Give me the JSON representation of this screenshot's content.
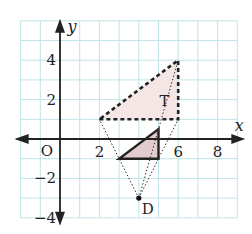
{
  "diagram": {
    "type": "coordinate-grid-enlargement",
    "grid": {
      "x_min": -2,
      "x_max": 9,
      "y_min": -4,
      "y_max": 6,
      "unit_px": 19.7,
      "origin_px": [
        60,
        139
      ],
      "line_color": "#bfe3e6"
    },
    "axes": {
      "x_label": "x",
      "y_label": "y",
      "origin_label": "O",
      "x_ticks": [
        {
          "value": 2,
          "label": "2"
        },
        {
          "value": 6,
          "label": "6"
        },
        {
          "value": 8,
          "label": "8"
        }
      ],
      "y_ticks": [
        {
          "value": 4,
          "label": "4"
        },
        {
          "value": 2,
          "label": "2"
        },
        {
          "value": -2,
          "label": "−2"
        },
        {
          "value": -4,
          "label": "−4"
        }
      ]
    },
    "shapes": {
      "T": {
        "label": "T",
        "vertices": [
          [
            2,
            1
          ],
          [
            6,
            1
          ],
          [
            6,
            4
          ]
        ],
        "style": "dashed",
        "fill": "#f5e6e6"
      },
      "image": {
        "label": "",
        "vertices": [
          [
            3,
            -1
          ],
          [
            5,
            -1
          ],
          [
            5,
            0.5
          ]
        ],
        "style": "solid",
        "fill": "#e3cccf"
      }
    },
    "center": {
      "label": "D",
      "point": [
        4,
        -3
      ]
    },
    "rays": [
      {
        "from": [
          4,
          -3
        ],
        "to": [
          2,
          1
        ]
      },
      {
        "from": [
          4,
          -3
        ],
        "to": [
          6,
          1
        ]
      },
      {
        "from": [
          4,
          -3
        ],
        "to": [
          6,
          4
        ]
      }
    ]
  }
}
